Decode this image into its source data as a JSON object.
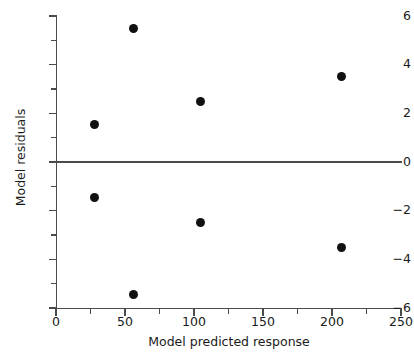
{
  "chart_data": {
    "type": "scatter",
    "title": "",
    "subtitle": "",
    "xlabel": "Model predicted response",
    "ylabel": "Model residuals",
    "xlim": [
      0,
      250
    ],
    "ylim": [
      -6,
      6
    ],
    "x_ticks": [
      0,
      50,
      100,
      150,
      200,
      250
    ],
    "x_tick_labels": [
      "0",
      "50",
      "100",
      "150",
      "200",
      "250"
    ],
    "x_minor_ticks": [
      25,
      75,
      125,
      175,
      225
    ],
    "y_ticks": [
      6,
      4,
      2,
      0,
      -2,
      -4,
      -6
    ],
    "y_tick_labels": [
      "6",
      "4",
      "2",
      "0",
      "−2",
      "−4",
      "−6"
    ],
    "y_minor_ticks": [
      5,
      3,
      1,
      -1,
      -3,
      -5
    ],
    "grid": false,
    "legend": null,
    "reference_lines": [
      {
        "name": "zero-residual-line",
        "orientation": "horizontal",
        "y": 0,
        "color": "#4a4a4a"
      }
    ],
    "marker": {
      "shape": "circle",
      "color": "#111111",
      "size": 9
    },
    "points": [
      {
        "x": 28,
        "y": 1.55
      },
      {
        "x": 28,
        "y": -1.45
      },
      {
        "x": 56,
        "y": 5.5
      },
      {
        "x": 56,
        "y": -5.45
      },
      {
        "x": 105,
        "y": 2.5
      },
      {
        "x": 105,
        "y": -2.5
      },
      {
        "x": 207,
        "y": 3.5
      },
      {
        "x": 207,
        "y": -3.5
      }
    ]
  },
  "colors": {
    "axis": "#4a4a4a",
    "marker": "#111111",
    "text": "#1a1a1a",
    "background": "#ffffff"
  }
}
